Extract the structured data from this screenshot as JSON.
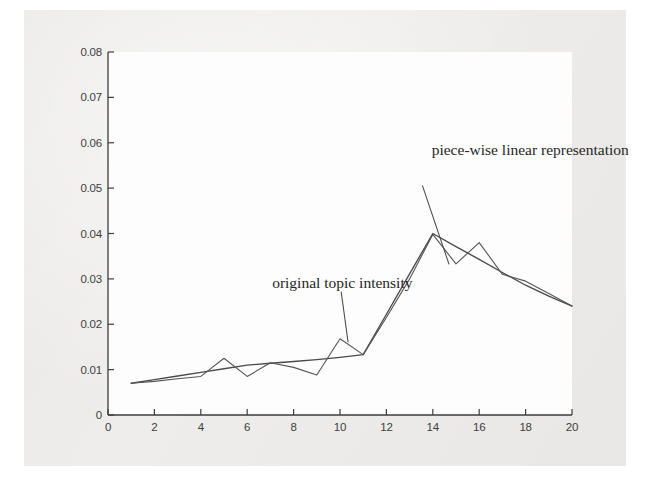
{
  "figure": {
    "background_color": "#eeedeb",
    "page_color": "#ffffff",
    "plot_background": "#fdfdfd",
    "axis_color": "#3d3d3d",
    "series_color": "#4a4a4a"
  },
  "chart_data": {
    "type": "line",
    "title": "",
    "xlabel": "",
    "ylabel": "",
    "xlim": [
      0,
      20
    ],
    "ylim": [
      0,
      0.08
    ],
    "grid": false,
    "legend": "annotations",
    "xticks": [
      0,
      2,
      4,
      6,
      8,
      10,
      12,
      14,
      16,
      18,
      20
    ],
    "xtick_labels": [
      "0",
      "2",
      "4",
      "6",
      "8",
      "10",
      "12",
      "14",
      "16",
      "18",
      "20"
    ],
    "yticks": [
      0,
      0.01,
      0.02,
      0.03,
      0.04,
      0.05,
      0.06,
      0.07,
      0.08
    ],
    "ytick_labels": [
      "0",
      "0.01",
      "0.02",
      "0.03",
      "0.04",
      "0.05",
      "0.06",
      "0.07",
      "0.08"
    ],
    "x": [
      1,
      2,
      3,
      4,
      5,
      6,
      7,
      8,
      9,
      10,
      11,
      12,
      13,
      14,
      15,
      16,
      17,
      18,
      19,
      20
    ],
    "series": [
      {
        "name": "original topic intensity",
        "values": [
          0.007,
          0.0074,
          0.008,
          0.0085,
          0.0125,
          0.0085,
          0.0115,
          0.0105,
          0.0088,
          0.0168,
          0.0133,
          0.0215,
          0.03,
          0.0398,
          0.0333,
          0.038,
          0.031,
          0.0295,
          0.0268,
          0.024
        ]
      },
      {
        "name": "piece-wise linear representation",
        "values": [
          0.007,
          0.0078,
          0.0086,
          0.0094,
          0.0102,
          0.011,
          0.0114,
          0.0118,
          0.0122,
          0.0127,
          0.0133,
          0.0222,
          0.0311,
          0.04,
          0.0371,
          0.0343,
          0.0314,
          0.0286,
          0.0262,
          0.024
        ],
        "breakpoints": [
          1,
          11,
          14,
          20
        ]
      }
    ],
    "annotations": [
      {
        "id": "original-topic-intensity",
        "text": "original topic intensity",
        "text_x": 10.1,
        "text_y": 0.0292,
        "leader_from": [
          10.05,
          0.0272
        ],
        "leader_to": [
          10.35,
          0.016
        ]
      },
      {
        "id": "piece-wise-linear-representation",
        "text": "piece-wise linear representation",
        "text_x": 18.2,
        "text_y": 0.0585,
        "leader_from": [
          13.55,
          0.0506
        ],
        "leader_to": [
          14.7,
          0.0332
        ]
      }
    ]
  }
}
